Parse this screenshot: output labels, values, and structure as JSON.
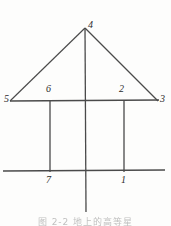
{
  "figure": {
    "kind": "geometry-diagram",
    "background_color": "#fdfdfc",
    "stroke_color": "#4a4a4a",
    "label_color": "#2b2b2b",
    "points": [
      {
        "id": "p4",
        "label": "4",
        "x": 88,
        "y": 20,
        "role": "apex"
      },
      {
        "id": "p5",
        "label": "5",
        "x": 4,
        "y": 94,
        "role": "left-base-vertex"
      },
      {
        "id": "p6",
        "label": "6",
        "x": 46,
        "y": 84,
        "role": "left-inner-node"
      },
      {
        "id": "p2",
        "label": "2",
        "x": 119,
        "y": 84,
        "role": "right-inner-node"
      },
      {
        "id": "p3",
        "label": "3",
        "x": 160,
        "y": 94,
        "role": "right-base-vertex"
      },
      {
        "id": "p7",
        "label": "7",
        "x": 46,
        "y": 175,
        "role": "left-foot"
      },
      {
        "id": "p1",
        "label": "1",
        "x": 121,
        "y": 175,
        "role": "right-foot"
      }
    ],
    "segments": [
      {
        "id": "seg-apex-to-left",
        "name": "triangle-left-side",
        "x1": 85,
        "y1": 28,
        "x2": 10,
        "y2": 101
      },
      {
        "id": "seg-apex-to-right",
        "name": "triangle-right-side",
        "x1": 85,
        "y1": 28,
        "x2": 158,
        "y2": 101
      },
      {
        "id": "seg-mid-horizontal",
        "name": "upper-horizontal-line",
        "x1": 10,
        "y1": 101,
        "x2": 159,
        "y2": 100
      },
      {
        "id": "seg-center-vertical",
        "name": "center-vertical-axis",
        "x1": 85,
        "y1": 28,
        "x2": 86,
        "y2": 212
      },
      {
        "id": "seg-left-vertical",
        "name": "left-dropline",
        "x1": 50,
        "y1": 101,
        "x2": 50,
        "y2": 172
      },
      {
        "id": "seg-right-vertical",
        "name": "right-dropline",
        "x1": 124,
        "y1": 100,
        "x2": 124,
        "y2": 172
      },
      {
        "id": "seg-bottom-horizontal",
        "name": "lower-horizontal-line",
        "x1": 3,
        "y1": 171,
        "x2": 165,
        "y2": 170
      }
    ]
  },
  "caption": {
    "text": "图 2-2  地上的高等星",
    "note": "caption is cropped at the bottom edge of the screenshot"
  }
}
